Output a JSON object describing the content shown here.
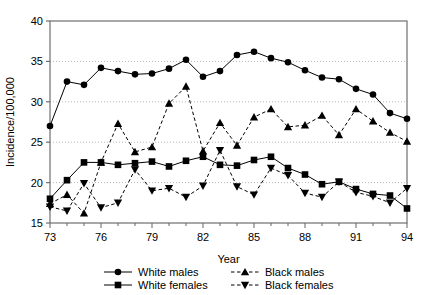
{
  "chart_data": {
    "type": "line",
    "title": "",
    "xlabel": "Year",
    "ylabel": "Incidence/100,000",
    "xlim": [
      73,
      94
    ],
    "ylim": [
      15,
      40
    ],
    "xticks": [
      73,
      76,
      79,
      82,
      85,
      88,
      91,
      94
    ],
    "xtick_labels": [
      "73",
      "76",
      "79",
      "82",
      "85",
      "88",
      "91",
      "94"
    ],
    "yticks": [
      15,
      20,
      25,
      30,
      35,
      40
    ],
    "ytick_labels": [
      "15",
      "20",
      "25",
      "30",
      "35",
      "40"
    ],
    "minor_xticks_every": 1,
    "grid": "horizontal-dotted at 20,25,30,35",
    "gridlines": [
      20,
      25,
      30,
      35
    ],
    "legend_position": "below-axes",
    "x": [
      73,
      74,
      75,
      76,
      77,
      78,
      79,
      80,
      81,
      82,
      83,
      84,
      85,
      86,
      87,
      88,
      89,
      90,
      91,
      92,
      93,
      94
    ],
    "series": [
      {
        "name": "White males",
        "marker": "circle",
        "linestyle": "solid",
        "color": "#000000",
        "values": [
          27.0,
          32.5,
          32.1,
          34.2,
          33.8,
          33.4,
          33.5,
          34.1,
          35.2,
          33.1,
          33.8,
          35.8,
          36.2,
          35.4,
          34.9,
          33.9,
          33.0,
          32.8,
          31.6,
          30.9,
          28.6,
          27.9
        ]
      },
      {
        "name": "White females",
        "marker": "square",
        "linestyle": "solid",
        "color": "#000000",
        "values": [
          18.0,
          20.3,
          22.5,
          22.5,
          22.2,
          22.4,
          22.6,
          22.0,
          22.7,
          23.2,
          22.2,
          22.1,
          22.8,
          23.2,
          21.8,
          21.0,
          19.8,
          20.1,
          19.2,
          18.6,
          18.4,
          16.8
        ]
      },
      {
        "name": "Black males",
        "marker": "triangle-up",
        "linestyle": "dashed",
        "color": "#000000",
        "values": [
          17.4,
          18.5,
          16.2,
          22.5,
          27.3,
          23.8,
          24.4,
          29.8,
          31.9,
          23.9,
          27.4,
          24.6,
          28.1,
          29.1,
          26.9,
          27.1,
          28.3,
          25.9,
          29.1,
          27.6,
          26.2,
          25.1
        ]
      },
      {
        "name": "Black females",
        "marker": "triangle-down",
        "linestyle": "dashed",
        "color": "#000000",
        "values": [
          17.0,
          16.5,
          19.9,
          16.9,
          17.5,
          21.6,
          19.0,
          19.3,
          18.2,
          19.6,
          24.0,
          19.5,
          18.5,
          21.8,
          20.9,
          18.7,
          18.2,
          20.1,
          18.8,
          18.3,
          17.5,
          19.3
        ]
      }
    ],
    "legend": [
      {
        "label": "White males",
        "marker": "circle",
        "linestyle": "solid"
      },
      {
        "label": "White females",
        "marker": "square",
        "linestyle": "solid"
      },
      {
        "label": "Black males",
        "marker": "triangle-up",
        "linestyle": "dashed"
      },
      {
        "label": "Black females",
        "marker": "triangle-down",
        "linestyle": "dashed"
      }
    ]
  },
  "colors": {
    "ink": "#000000",
    "grid": "#b8b8b8",
    "axis": "#6f6f6f",
    "background": "#ffffff"
  }
}
